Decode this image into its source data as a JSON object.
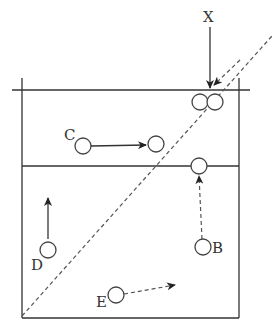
{
  "diagram": {
    "labels": {
      "X": "X",
      "B": "B",
      "C": "C",
      "D": "D",
      "E": "E"
    },
    "colors": {
      "line": "#333333",
      "dashed": "#555555",
      "background": "#ffffff"
    }
  }
}
